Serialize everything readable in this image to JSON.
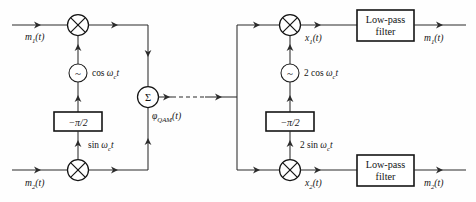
{
  "figure": {
    "background_color": "#fefefe",
    "line_color": "#2b2b2b"
  },
  "modulator": {
    "inputs": [
      {
        "name": "m1-input",
        "base": "m",
        "sub": "1",
        "arg": "(t)",
        "full": "m₁(t)"
      },
      {
        "name": "m2-input",
        "base": "m",
        "sub": "2",
        "arg": "(t)",
        "full": "m₂(t)"
      }
    ],
    "oscillator": {
      "glyph": "~",
      "label_prefix": "cos ",
      "label_omega": "ω",
      "label_sub": "c",
      "label_t": "t",
      "full": "cos ωᴄt"
    },
    "phase_shifter": {
      "label": "−π/2"
    },
    "quadrature_carrier": {
      "label_prefix": "sin ",
      "label_omega": "ω",
      "label_sub": "c",
      "label_t": "t",
      "full": "sin ωᴄt"
    },
    "summer": {
      "glyph": "Σ"
    },
    "output": {
      "base": "φ",
      "sub": "QAM",
      "arg": "(t)",
      "full": "φQAM(t)"
    },
    "multiplier_glyph": "⊗"
  },
  "channel": {
    "style": "dashed",
    "label": ""
  },
  "demodulator": {
    "oscillator": {
      "glyph": "~",
      "label_prefix": "2 cos ",
      "label_omega": "ω",
      "label_sub": "c",
      "label_t": "t",
      "full": "2 cos ωᴄt"
    },
    "phase_shifter": {
      "label": "−π/2"
    },
    "quadrature_carrier": {
      "label_prefix": "2 sin ",
      "label_omega": "ω",
      "label_sub": "c",
      "label_t": "t",
      "full": "2 sin ωᴄt"
    },
    "intermediate": [
      {
        "name": "x1-signal",
        "base": "x",
        "sub": "1",
        "arg": "(t)",
        "full": "x₁(t)"
      },
      {
        "name": "x2-signal",
        "base": "x",
        "sub": "2",
        "arg": "(t)",
        "full": "x₂(t)"
      }
    ],
    "filters": [
      {
        "name": "low-pass-filter-upper",
        "line1": "Low-pass",
        "line2": "filter"
      },
      {
        "name": "low-pass-filter-lower",
        "line1": "Low-pass",
        "line2": "filter"
      }
    ],
    "outputs": [
      {
        "name": "m1-output",
        "base": "m",
        "sub": "1",
        "arg": "(t)",
        "full": "m₁(t)"
      },
      {
        "name": "m2-output",
        "base": "m",
        "sub": "2",
        "arg": "(t)",
        "full": "m₂(t)"
      }
    ],
    "multiplier_glyph": "⊗"
  }
}
